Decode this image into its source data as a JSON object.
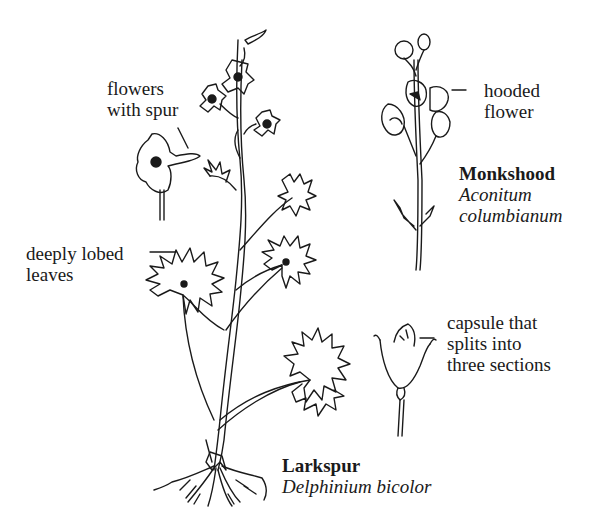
{
  "labels": {
    "flowers_with_spur": [
      "flowers",
      "with spur"
    ],
    "deeply_lobed_leaves": [
      "deeply lobed",
      "leaves"
    ],
    "hooded_flower": [
      "hooded",
      "flower"
    ],
    "capsule": [
      "capsule that",
      "splits into",
      "three sections"
    ]
  },
  "plants": {
    "monkshood": {
      "common_name": "Monkshood",
      "scientific_name": [
        "Aconitum",
        "columbianum"
      ]
    },
    "larkspur": {
      "common_name": "Larkspur",
      "scientific_name": "Delphinium bicolor"
    }
  },
  "colors": {
    "ink": "#1a1a1a",
    "background": "#ffffff"
  }
}
